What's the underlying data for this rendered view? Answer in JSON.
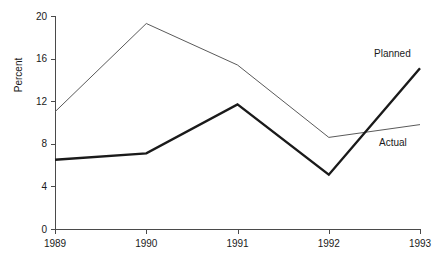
{
  "chart_data": {
    "type": "line",
    "title": "",
    "subtitle": "",
    "xlabel": "",
    "ylabel": "Percent",
    "categories": [
      "1989",
      "1990",
      "1991",
      "1992",
      "1993"
    ],
    "x": [
      1989,
      1990,
      1991,
      1992,
      1993
    ],
    "xlim": [
      1989,
      1993
    ],
    "ylim": [
      0,
      20
    ],
    "yticks": [
      0,
      4,
      8,
      12,
      16,
      20
    ],
    "ytick_labels": [
      "0",
      "4",
      "8",
      "12",
      "16",
      "20"
    ],
    "xticks": [
      1989,
      1990,
      1991,
      1992,
      1993
    ],
    "xtick_labels": [
      "1989",
      "1990",
      "1991",
      "1992",
      "1993"
    ],
    "grid": false,
    "legend_position": "inline-right-end-of-line",
    "series": [
      {
        "name": "Planned",
        "style": "thick",
        "color": "#1a1a1a",
        "values": [
          6.5,
          7.1,
          11.7,
          5.1,
          15.1
        ],
        "label": "Planned"
      },
      {
        "name": "Actual",
        "style": "thin",
        "color": "#5a5a5a",
        "values": [
          11.0,
          19.3,
          15.4,
          8.6,
          9.8
        ],
        "label": "Actual"
      }
    ],
    "annotations": [
      {
        "text": "Planned",
        "series": "Planned",
        "x": 1993,
        "y": 15.1
      },
      {
        "text": "Actual",
        "series": "Actual",
        "x": 1993,
        "y": 9.8
      }
    ]
  },
  "colors": {
    "background": "#ffffff",
    "axis": "#4a4a4a",
    "text": "#1a1a1a",
    "planned": "#1a1a1a",
    "actual": "#5a5a5a"
  }
}
